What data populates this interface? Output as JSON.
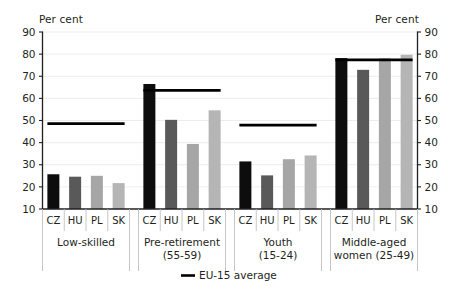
{
  "axis_titles": {
    "left": "Per cent",
    "right": "Per cent"
  },
  "legend": {
    "label": "EU-15 average",
    "marker": "line-marker-icon"
  },
  "chart_data": {
    "type": "bar",
    "title": "",
    "subtitle": "",
    "xlabel": "",
    "ylabel": "Per cent",
    "ylim": [
      10,
      90
    ],
    "yticks": [
      10,
      20,
      30,
      40,
      50,
      60,
      70,
      80,
      90
    ],
    "ytick_labels": [
      "10",
      "20",
      "30",
      "40",
      "50",
      "60",
      "70",
      "80",
      "90"
    ],
    "grid": true,
    "legend_position": "bottom-center",
    "dual_axis": true,
    "categories": [
      "CZ",
      "HU",
      "PL",
      "SK"
    ],
    "category_colors": [
      "#0d0d0d",
      "#595959",
      "#a6a6a6",
      "#b5b5b5"
    ],
    "groups": [
      {
        "name": "Low-skilled",
        "label_lines": [
          "Low-skilled"
        ],
        "values": [
          25.7,
          24.6,
          25.0,
          21.7
        ],
        "reference_line": 48.6
      },
      {
        "name": "Pre-retirement (55-59)",
        "label_lines": [
          "Pre-retirement",
          "(55-59)"
        ],
        "values": [
          66.5,
          50.3,
          39.4,
          54.6
        ],
        "reference_line": 63.6
      },
      {
        "name": "Youth (15-24)",
        "label_lines": [
          "Youth",
          "(15-24)"
        ],
        "values": [
          31.5,
          25.2,
          32.5,
          34.2
        ],
        "reference_line": 47.9
      },
      {
        "name": "Middle-aged women (25-49)",
        "label_lines": [
          "Middle-aged",
          "women (25-49)"
        ],
        "values": [
          78.2,
          72.9,
          78.1,
          79.7
        ],
        "reference_line": 77.4
      }
    ],
    "series": [
      {
        "name": "CZ",
        "values": [
          25.7,
          66.5,
          31.5,
          78.2
        ]
      },
      {
        "name": "HU",
        "values": [
          24.6,
          50.3,
          25.2,
          72.9
        ]
      },
      {
        "name": "PL",
        "values": [
          25.0,
          39.4,
          32.5,
          78.1
        ]
      },
      {
        "name": "SK",
        "values": [
          21.7,
          54.6,
          34.2,
          79.7
        ]
      },
      {
        "name": "EU-15 average",
        "values": [
          48.6,
          63.6,
          47.9,
          77.4
        ]
      }
    ]
  }
}
